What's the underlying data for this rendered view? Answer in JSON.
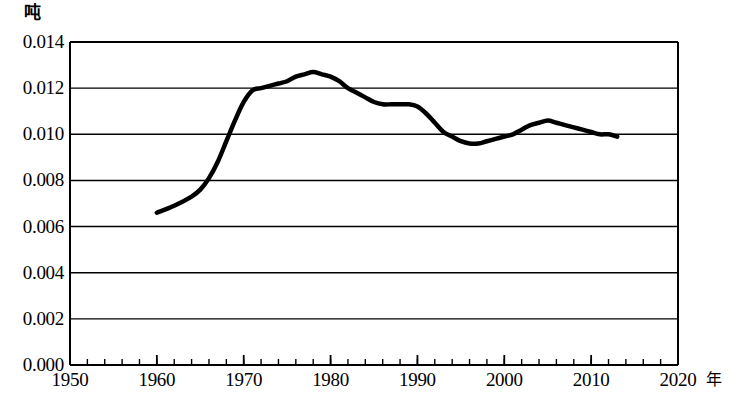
{
  "chart_data": {
    "type": "line",
    "title": "",
    "ylabel": "吨",
    "xlabel": "年",
    "ylim": [
      0.0,
      0.014
    ],
    "xlim": [
      1950,
      2020
    ],
    "grid": true,
    "legend": "none",
    "y_ticks": [
      "0.000",
      "0.002",
      "0.004",
      "0.006",
      "0.008",
      "0.010",
      "0.012",
      "0.014"
    ],
    "y_tick_values": [
      0.0,
      0.002,
      0.004,
      0.006,
      0.008,
      0.01,
      0.012,
      0.014
    ],
    "x_ticks": [
      "1950",
      "1960",
      "1970",
      "1980",
      "1990",
      "2000",
      "2010",
      "2020"
    ],
    "x_tick_values": [
      1950,
      1960,
      1970,
      1980,
      1990,
      2000,
      2010,
      2020
    ],
    "x_minor_tick_step": 2,
    "series": [
      {
        "name": "",
        "color": "#000000",
        "x": [
          1960,
          1962,
          1964,
          1965,
          1966,
          1967,
          1968,
          1969,
          1970,
          1971,
          1972,
          1973,
          1974,
          1975,
          1976,
          1977,
          1978,
          1979,
          1980,
          1981,
          1982,
          1983,
          1984,
          1985,
          1986,
          1987,
          1988,
          1989,
          1990,
          1991,
          1992,
          1993,
          1994,
          1995,
          1996,
          1997,
          1998,
          1999,
          2000,
          2001,
          2002,
          2003,
          2004,
          2005,
          2006,
          2007,
          2008,
          2009,
          2010,
          2011,
          2012,
          2013
        ],
        "values": [
          0.0066,
          0.0069,
          0.0073,
          0.0076,
          0.0081,
          0.0088,
          0.0097,
          0.0106,
          0.0114,
          0.0119,
          0.012,
          0.0121,
          0.0122,
          0.0123,
          0.0125,
          0.0126,
          0.0127,
          0.0126,
          0.0125,
          0.0123,
          0.012,
          0.0118,
          0.0116,
          0.0114,
          0.0113,
          0.0113,
          0.0113,
          0.0113,
          0.0112,
          0.0109,
          0.0105,
          0.0101,
          0.0099,
          0.0097,
          0.0096,
          0.0096,
          0.0097,
          0.0098,
          0.0099,
          0.01,
          0.0102,
          0.0104,
          0.0105,
          0.0106,
          0.0105,
          0.0104,
          0.0103,
          0.0102,
          0.0101,
          0.01,
          0.01,
          0.0099
        ]
      }
    ]
  }
}
